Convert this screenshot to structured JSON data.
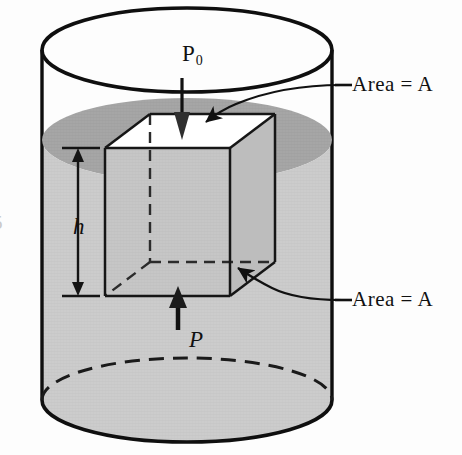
{
  "figure": {
    "name": "fluid-pressure-on-submerged-box",
    "background_color": "#fdfdfd"
  },
  "labels": {
    "pressure_top": "P",
    "pressure_top_subscript": "0",
    "pressure_bottom": "P",
    "depth": "h",
    "area_top": "Area = A",
    "area_bottom": "Area = A",
    "figure_number_partial": "5"
  },
  "colors": {
    "ink": "#111111",
    "fluid_body": "#c8c8c8",
    "fluid_surface": "#a0a0a0",
    "box_top_face": "#ffffff",
    "box_front_face": "#c2c2c2",
    "box_side_face": "#bdbdbd",
    "cylinder_top_interior": "#fdfdfd",
    "outline": "#0f0f0f"
  },
  "geometry": {
    "cylinder": {
      "center_x": 187,
      "top_ellipse_cy": 50,
      "fluid_surface_cy": 140,
      "bottom_ellipse_cy": 400,
      "radius_x": 145,
      "radius_y": 42
    },
    "box": {
      "front_top_left_x": 105,
      "front_top_y": 148,
      "front_width": 125,
      "front_height": 148,
      "depth_offset_x": 45,
      "depth_offset_y": -34
    },
    "depth_dimension": {
      "x": 77,
      "y_top": 148,
      "y_bottom": 296,
      "label_y": 225
    }
  },
  "annotations": [
    {
      "name": "pressure-down-arrow",
      "direction": "down",
      "target": "box top face",
      "label": "P0"
    },
    {
      "name": "pressure-up-arrow",
      "direction": "up",
      "target": "box bottom face",
      "label": "P"
    },
    {
      "name": "depth-dimension-arrow",
      "direction": "both",
      "label": "h"
    },
    {
      "name": "leader-top-area",
      "label": "Area = A",
      "points_to": "box top face"
    },
    {
      "name": "leader-bottom-area",
      "label": "Area = A",
      "points_to": "box bottom face"
    }
  ]
}
